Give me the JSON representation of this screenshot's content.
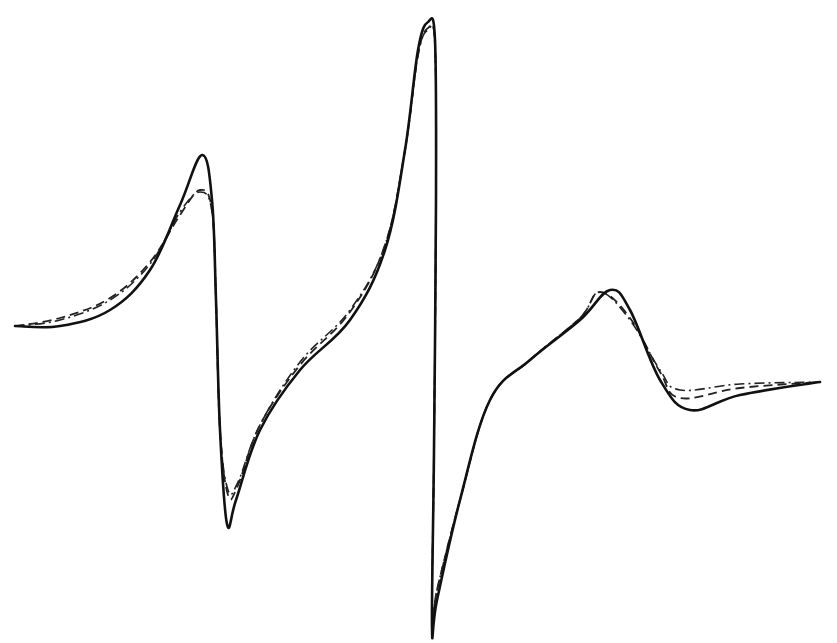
{
  "chart_data": {
    "type": "line",
    "title": "",
    "xlabel": "",
    "ylabel": "",
    "grid": false,
    "legend": null,
    "x_units": "pixels (no axis shown)",
    "series": [
      {
        "name": "solid",
        "style": "solid",
        "points": [
          [
            15,
            326
          ],
          [
            60,
            326
          ],
          [
            110,
            310
          ],
          [
            150,
            270
          ],
          [
            180,
            205
          ],
          [
            202,
            155
          ],
          [
            212,
            200
          ],
          [
            216,
            300
          ],
          [
            220,
            430
          ],
          [
            227,
            524
          ],
          [
            236,
            500
          ],
          [
            260,
            430
          ],
          [
            300,
            370
          ],
          [
            350,
            320
          ],
          [
            385,
            250
          ],
          [
            405,
            150
          ],
          [
            418,
            50
          ],
          [
            428,
            22
          ],
          [
            435,
            40
          ],
          [
            436,
            200
          ],
          [
            434,
            450
          ],
          [
            432,
            628
          ],
          [
            437,
            600
          ],
          [
            460,
            500
          ],
          [
            490,
            400
          ],
          [
            530,
            360
          ],
          [
            580,
            320
          ],
          [
            610,
            290
          ],
          [
            630,
            310
          ],
          [
            660,
            380
          ],
          [
            690,
            410
          ],
          [
            740,
            395
          ],
          [
            820,
            382
          ]
        ]
      },
      {
        "name": "dashed",
        "style": "dashed",
        "points": [
          [
            15,
            326
          ],
          [
            60,
            318
          ],
          [
            110,
            298
          ],
          [
            150,
            262
          ],
          [
            180,
            215
          ],
          [
            200,
            190
          ],
          [
            212,
            210
          ],
          [
            216,
            300
          ],
          [
            220,
            430
          ],
          [
            228,
            495
          ],
          [
            238,
            485
          ],
          [
            260,
            425
          ],
          [
            300,
            365
          ],
          [
            350,
            312
          ],
          [
            385,
            245
          ],
          [
            405,
            150
          ],
          [
            418,
            55
          ],
          [
            428,
            28
          ],
          [
            435,
            45
          ],
          [
            436,
            200
          ],
          [
            434,
            450
          ],
          [
            432,
            620
          ],
          [
            437,
            590
          ],
          [
            460,
            500
          ],
          [
            490,
            400
          ],
          [
            530,
            360
          ],
          [
            580,
            318
          ],
          [
            600,
            292
          ],
          [
            630,
            318
          ],
          [
            660,
            372
          ],
          [
            680,
            398
          ],
          [
            740,
            388
          ],
          [
            820,
            382
          ]
        ]
      },
      {
        "name": "dash-dot",
        "style": "dash-dot",
        "points": [
          [
            15,
            326
          ],
          [
            60,
            320
          ],
          [
            110,
            300
          ],
          [
            150,
            264
          ],
          [
            180,
            212
          ],
          [
            200,
            192
          ],
          [
            212,
            212
          ],
          [
            216,
            300
          ],
          [
            220,
            430
          ],
          [
            228,
            490
          ],
          [
            238,
            482
          ],
          [
            260,
            425
          ],
          [
            300,
            362
          ],
          [
            350,
            310
          ],
          [
            385,
            245
          ],
          [
            405,
            150
          ],
          [
            418,
            55
          ],
          [
            428,
            30
          ],
          [
            435,
            45
          ],
          [
            436,
            200
          ],
          [
            434,
            450
          ],
          [
            432,
            620
          ],
          [
            437,
            590
          ],
          [
            460,
            500
          ],
          [
            490,
            400
          ],
          [
            530,
            360
          ],
          [
            580,
            318
          ],
          [
            600,
            292
          ],
          [
            630,
            320
          ],
          [
            660,
            370
          ],
          [
            680,
            390
          ],
          [
            740,
            384
          ],
          [
            820,
            382
          ]
        ]
      }
    ]
  }
}
